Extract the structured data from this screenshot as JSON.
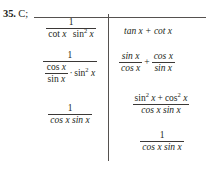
{
  "problem": {
    "number": "35.",
    "answer_code": "C;"
  },
  "math": {
    "x": "x",
    "one": "1",
    "plus": "+",
    "dot": "·",
    "sup2": "2",
    "tan": "tan",
    "cot": "cot",
    "sin": "sin",
    "cos": "cos"
  },
  "left_column": {
    "expr1": {
      "numerator": "1",
      "denominator_prefix": "cot",
      "denominator_x1": "x",
      "denominator_fn2": "sin",
      "denominator_exp2": "2",
      "denominator_x2": "x"
    },
    "expr2": {
      "numerator": "1",
      "den_frac_num_fn": "cos",
      "den_frac_num_x": "x",
      "den_frac_den_fn": "sin",
      "den_frac_den_x": "x",
      "den_mult": "·",
      "den_tail_fn": "sin",
      "den_tail_exp": "2",
      "den_tail_x": "x"
    },
    "expr3": {
      "numerator": "1",
      "denominator": "cos x sin x"
    }
  },
  "right_column": {
    "expr1": {
      "text": "tan x + cot x"
    },
    "expr2": {
      "term1_num": "sin x",
      "term1_den": "cos x",
      "operator": "+",
      "term2_num": "cos x",
      "term2_den": "sin x"
    },
    "expr3": {
      "num_fn1": "sin",
      "num_exp1": "2",
      "num_x1": "x",
      "num_op": "+",
      "num_fn2": "cos",
      "num_exp2": "2",
      "num_x2": "x",
      "denominator": "cos x sin x"
    },
    "expr4": {
      "numerator": "1",
      "denominator": "cos x sin x"
    }
  },
  "colors": {
    "ink": "#231f20",
    "rule": "#55514f",
    "background": "#ffffff"
  }
}
